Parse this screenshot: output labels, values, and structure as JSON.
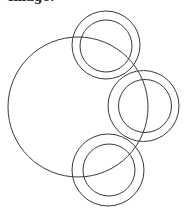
{
  "caption": {
    "text": "Image:"
  },
  "diagram": {
    "stroke_color": "#3a3a3a",
    "large_circle": {
      "cx": 78,
      "cy": 107,
      "r": 70
    },
    "rings": [
      {
        "name": "top",
        "outer": {
          "cx": 106,
          "cy": 45,
          "r": 34
        },
        "inner": {
          "cx": 106,
          "cy": 46,
          "r": 26
        }
      },
      {
        "name": "middle",
        "outer": {
          "cx": 143.5,
          "cy": 106,
          "r": 35.5
        },
        "inner": {
          "cx": 145,
          "cy": 106,
          "r": 26.5
        }
      },
      {
        "name": "bottom",
        "outer": {
          "cx": 108,
          "cy": 170,
          "r": 36
        },
        "inner": {
          "cx": 109,
          "cy": 170,
          "r": 26
        }
      }
    ]
  }
}
